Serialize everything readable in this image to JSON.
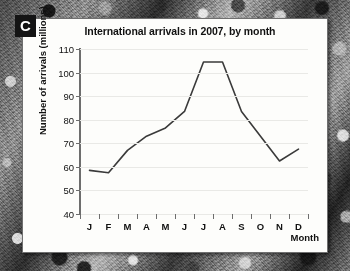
{
  "figure": {
    "panel_label": "C",
    "background_accent": "#fdfdfb",
    "line_color": "#3a3a3a"
  },
  "chart_data": {
    "type": "line",
    "title": "International arrivals in 2007, by month",
    "xlabel": "Month",
    "ylabel": "Number of arrivals (millions)",
    "categories": [
      "J",
      "F",
      "M",
      "A",
      "M",
      "J",
      "J",
      "A",
      "S",
      "O",
      "N",
      "D"
    ],
    "category_names": [
      "January",
      "February",
      "March",
      "April",
      "May",
      "June",
      "July",
      "August",
      "September",
      "October",
      "November",
      "December"
    ],
    "values": [
      58.5,
      57.5,
      67,
      73,
      76.5,
      83.5,
      104.5,
      104.5,
      83.5,
      73,
      62.5,
      67.5
    ],
    "ylim": [
      40,
      110
    ],
    "yticks": [
      40,
      50,
      60,
      70,
      80,
      90,
      100,
      110
    ],
    "ytick_labels": [
      "40",
      "50",
      "60",
      "70",
      "80",
      "90",
      "100",
      "110"
    ],
    "grid": true,
    "legend": "none",
    "series_name": "International arrivals"
  }
}
